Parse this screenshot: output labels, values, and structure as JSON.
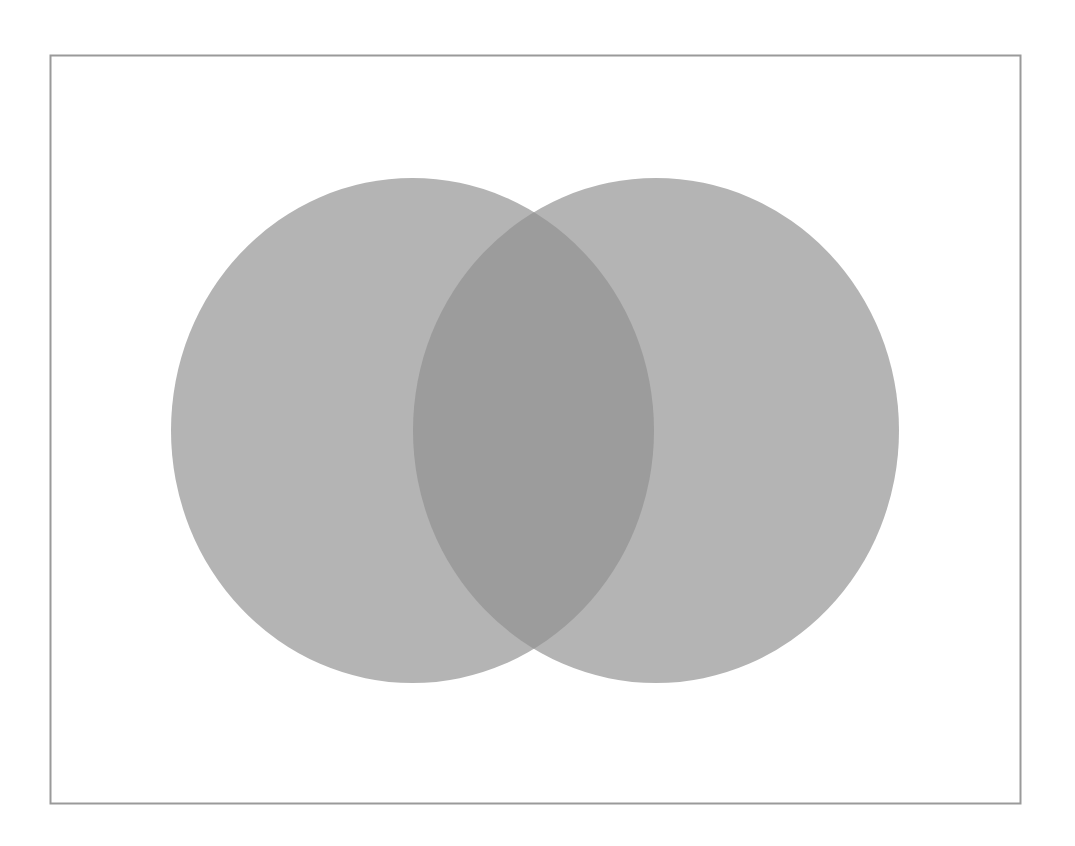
{
  "diagram": {
    "type": "venn",
    "sets": 2,
    "labels": [],
    "frame": {
      "x": 50.5,
      "y": 55.5,
      "width": 970,
      "height": 748,
      "stroke": "#9a9a9a",
      "stroke_width": 2
    },
    "circles": [
      {
        "name": "left-set",
        "cx": 412.5,
        "cy": 430.5,
        "rx": 241.5,
        "ry": 252.5,
        "fill": "#a8a8a8",
        "opacity": 0.85
      },
      {
        "name": "right-set",
        "cx": 656,
        "cy": 430.5,
        "rx": 243,
        "ry": 252.5,
        "fill": "#a8a8a8",
        "opacity": 0.85
      }
    ],
    "colors": {
      "background": "#ffffff",
      "circle_fill": "#b4b4b4",
      "overlap_fill": "#9c9c9c"
    }
  }
}
